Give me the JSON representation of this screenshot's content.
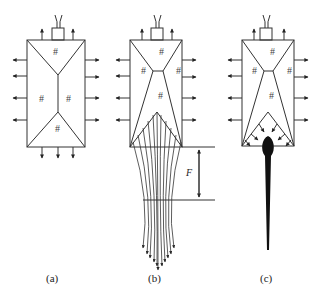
{
  "figure": {
    "panels": [
      {
        "id": "a",
        "label": "(a)",
        "region_mark": "#"
      },
      {
        "id": "b",
        "label": "(b)",
        "region_mark": "#",
        "dimension_label": "F"
      },
      {
        "id": "c",
        "label": "(c)",
        "region_mark": "#"
      }
    ],
    "colors": {
      "line": "#333333",
      "background": "#ffffff"
    }
  }
}
